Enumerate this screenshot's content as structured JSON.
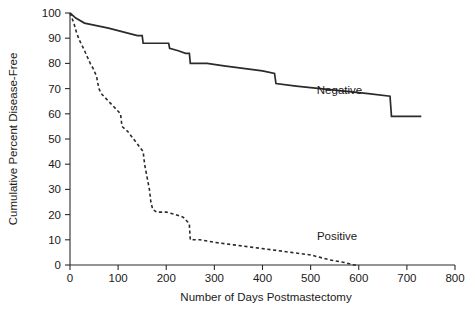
{
  "chart_data": {
    "type": "line",
    "title": "",
    "xlabel": "Number of Days Postmastectomy",
    "ylabel": "Cumulative Percent Disease-Free",
    "xlim": [
      0,
      800
    ],
    "ylim": [
      0,
      100
    ],
    "xticks": [
      0,
      100,
      200,
      300,
      400,
      500,
      600,
      700,
      800
    ],
    "xtick_labels": [
      "0",
      "100",
      "200",
      "300",
      "400",
      "500",
      "600",
      "700",
      "800"
    ],
    "yticks": [
      0,
      10,
      20,
      30,
      40,
      50,
      60,
      70,
      80,
      90,
      100
    ],
    "ytick_labels": [
      "0",
      "10",
      "20",
      "30",
      "40",
      "50",
      "60",
      "70",
      "80",
      "90",
      "100"
    ],
    "grid": false,
    "legend_position": "inline-annotation",
    "series": [
      {
        "name": "Negative",
        "style": "solid",
        "label_x": 560,
        "label_y": 68,
        "points": [
          [
            0,
            100
          ],
          [
            12,
            98
          ],
          [
            30,
            96
          ],
          [
            55,
            95
          ],
          [
            80,
            94
          ],
          [
            100,
            93
          ],
          [
            120,
            92
          ],
          [
            140,
            91
          ],
          [
            150,
            91
          ],
          [
            152,
            88
          ],
          [
            175,
            88
          ],
          [
            205,
            88
          ],
          [
            207,
            86
          ],
          [
            225,
            85
          ],
          [
            240,
            84
          ],
          [
            248,
            84
          ],
          [
            250,
            80
          ],
          [
            285,
            80
          ],
          [
            320,
            79
          ],
          [
            360,
            78
          ],
          [
            400,
            77
          ],
          [
            425,
            76
          ],
          [
            428,
            72
          ],
          [
            470,
            71
          ],
          [
            520,
            70
          ],
          [
            570,
            69
          ],
          [
            620,
            68
          ],
          [
            665,
            67
          ],
          [
            668,
            59
          ],
          [
            700,
            59
          ],
          [
            730,
            59
          ]
        ]
      },
      {
        "name": "Positive",
        "style": "dashed",
        "label_x": 555,
        "label_y": 10,
        "points": [
          [
            0,
            100
          ],
          [
            8,
            96
          ],
          [
            14,
            92
          ],
          [
            20,
            89
          ],
          [
            28,
            86
          ],
          [
            35,
            83
          ],
          [
            42,
            80
          ],
          [
            48,
            78
          ],
          [
            55,
            75
          ],
          [
            58,
            72
          ],
          [
            60,
            70
          ],
          [
            65,
            68
          ],
          [
            70,
            67
          ],
          [
            80,
            65
          ],
          [
            90,
            63
          ],
          [
            100,
            61
          ],
          [
            105,
            60
          ],
          [
            108,
            55
          ],
          [
            120,
            53
          ],
          [
            132,
            50
          ],
          [
            140,
            48
          ],
          [
            148,
            46
          ],
          [
            152,
            45
          ],
          [
            155,
            40
          ],
          [
            160,
            35
          ],
          [
            165,
            30
          ],
          [
            168,
            25
          ],
          [
            172,
            22
          ],
          [
            180,
            21
          ],
          [
            200,
            21
          ],
          [
            220,
            20
          ],
          [
            235,
            19
          ],
          [
            245,
            17
          ],
          [
            248,
            16
          ],
          [
            250,
            10
          ],
          [
            270,
            10
          ],
          [
            300,
            9
          ],
          [
            340,
            8
          ],
          [
            380,
            7
          ],
          [
            420,
            6
          ],
          [
            460,
            5
          ],
          [
            500,
            4
          ],
          [
            540,
            2
          ],
          [
            570,
            1
          ],
          [
            590,
            0
          ],
          [
            598,
            0
          ]
        ]
      }
    ]
  },
  "annotations": {
    "negative_label": "Negative",
    "positive_label": "Positive"
  },
  "colors": {
    "ink": "#2b2b2b",
    "background": "#ffffff"
  }
}
